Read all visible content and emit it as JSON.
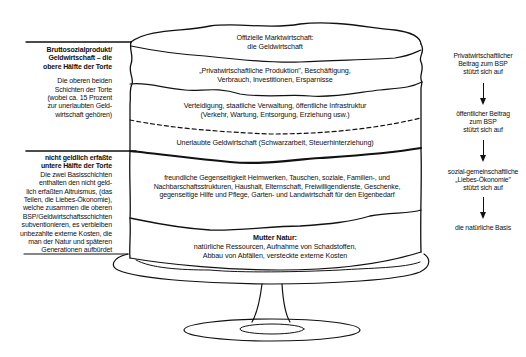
{
  "diagram": {
    "type": "layered-cake-economy",
    "layers": [
      {
        "id": "top",
        "title": "Offizielle Marktwirtschaft:",
        "subtitle": "die Geldwirtschaft"
      },
      {
        "id": "private",
        "line1": "„Privatwirtschaftliche Produktion\", Beschäftigung,",
        "line2": "Verbrauch, Investitionen, Ersparnisse"
      },
      {
        "id": "public",
        "line1": "Verteidigung, staatliche Verwaltung, öffentliche Infrastruktur",
        "line2": "(Verkehr, Wartung, Entsorgung, Erziehung usw.)"
      },
      {
        "id": "illegal",
        "line1": "Unerlaubte Geldwirtschaft (Schwarzarbeit, Steuerhinterziehung)"
      },
      {
        "id": "love",
        "line1": "freundliche Gegenseitigkeit  Heimwerken, Tauschen, soziale, Familien-, und",
        "line2": "Nachbarschaftsstrukturen, Haushalt, Elternschaft, Freiwilligendienste, Geschenke,",
        "line3": "gegenseitige Hilfe und Pflege, Garten- und Landwirtschaft für den Eigenbedarf"
      },
      {
        "id": "nature",
        "title": "Mutter Natur:",
        "line1": "natürliche Ressourcen, Aufnahme von Schadstoffen,",
        "line2": "Abbau von Abfällen, versteckte externe Kosten"
      }
    ],
    "left_upper": {
      "heading": [
        "Bruttosozialprodukt/",
        "Geldwirtschaft – die",
        "obere Hälfte der Torte"
      ],
      "body": [
        "Die oberen beiden",
        "Schichten der Torte",
        "(wobei ca. 15 Prozent",
        "zur unerlaubten Geld-",
        "wirtschaft gehören)"
      ]
    },
    "left_lower": {
      "heading": [
        "nicht geldlich erfaßte",
        "untere Hälfte der Torte"
      ],
      "body": [
        "Die zwei Basisschichten",
        "enthalten den nicht geld-",
        "lich erfaßten Altruismus, (das",
        "Teilen, die Liebes-Ökonomie),",
        "welche zusammen die oberen",
        "BSP/Geldwirtschaftsschichten",
        "subventionieren, es verbleiben",
        "unbezahlte externe Kosten, die",
        "man der Natur und späteren",
        "Generationen aufbürdet"
      ]
    },
    "right_chain": [
      {
        "lines": [
          "Privatwirtschaftlicher",
          "Beitrag zum BSP",
          "stützt sich auf"
        ]
      },
      {
        "lines": [
          "öffentlicher Beitrag",
          "zum BSP",
          "stützt sich auf"
        ]
      },
      {
        "lines": [
          "sozial-gemeinschaftliche",
          "„Liebes-Ökonomie\"",
          "stützt sich auf"
        ]
      },
      {
        "lines": [
          "die natürliche Basis"
        ]
      }
    ],
    "colors": {
      "ink": "#111111",
      "background": "#ffffff"
    }
  }
}
